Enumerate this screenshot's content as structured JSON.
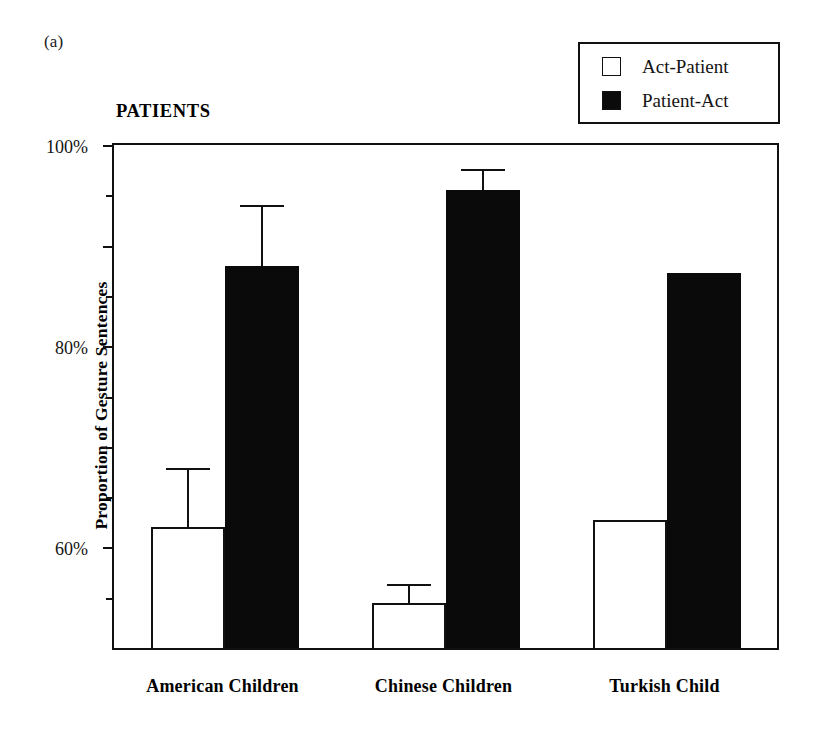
{
  "figure": {
    "panel_label": "(a)",
    "title": "PATIENTS"
  },
  "legend": {
    "entries": [
      {
        "label": "Act-Patient",
        "swatch": "hollow-square-icon",
        "color": "#ffffff"
      },
      {
        "label": "Patient-Act",
        "swatch": "filled-square-icon",
        "color": "#0a0a0a"
      }
    ]
  },
  "axes": {
    "y_title": "Proportion of Gesture Sentences",
    "y_major_ticks": [
      "100%",
      "80%",
      "60%",
      "40%",
      "20%"
    ],
    "y_major_values": [
      100,
      80,
      60,
      40,
      20
    ],
    "y_minor_values": [
      90,
      70,
      50,
      30,
      10
    ],
    "y_min": 0,
    "y_max": 100
  },
  "chart_data": {
    "type": "bar",
    "title": "PATIENTS",
    "xlabel": "",
    "ylabel": "Proportion of Gesture Sentences",
    "ylim": [
      0,
      100
    ],
    "grid": false,
    "legend_position": "top-right",
    "categories": [
      "American Children",
      "Chinese Children",
      "Turkish Child"
    ],
    "series": [
      {
        "name": "Act-Patient",
        "color": "#ffffff",
        "values": [
          24,
          9,
          25.5
        ],
        "errors_upper": [
          35.7,
          12.7,
          null
        ]
      },
      {
        "name": "Patient-Act",
        "color": "#0a0a0a",
        "values": [
          76,
          91,
          74.5
        ],
        "errors_upper": [
          88,
          95.3,
          null
        ]
      }
    ],
    "annotations": [
      "(a)"
    ]
  }
}
